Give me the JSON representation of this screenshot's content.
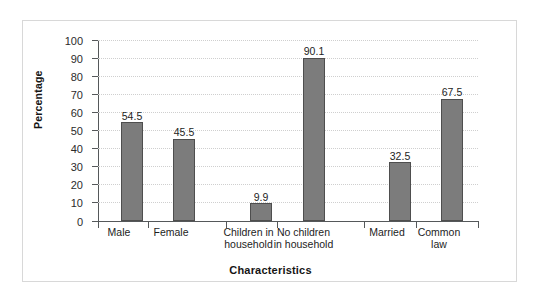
{
  "chart_data": {
    "type": "bar",
    "title": "",
    "subtitle": "",
    "xlabel": "Characteristics",
    "ylabel": "Percentage",
    "categories": [
      "Male",
      "Female",
      "Children in\nhousehold",
      "No children\nin household",
      "Married",
      "Common\nlaw"
    ],
    "values": [
      54.5,
      45.5,
      9.9,
      90.1,
      32.5,
      67.5
    ],
    "value_labels": [
      "54.5",
      "45.5",
      "9.9",
      "90.1",
      "32.5",
      "67.5"
    ],
    "ylim": [
      0,
      100
    ],
    "ytick_step": 10,
    "ytick_labels": [
      "100",
      "90",
      "80",
      "70",
      "60",
      "50",
      "40",
      "30",
      "20",
      "10",
      "0"
    ],
    "ytick_values": [
      100,
      90,
      80,
      70,
      60,
      50,
      40,
      30,
      20,
      10,
      0
    ],
    "grid": true,
    "grid_axis": "y",
    "grid_style": "dotted",
    "legend": false,
    "legend_position": "none",
    "groups": [
      {
        "name": "sex",
        "categories": [
          "Male",
          "Female"
        ]
      },
      {
        "name": "children",
        "categories": [
          "Children in household",
          "No children in household"
        ]
      },
      {
        "name": "marital-status",
        "categories": [
          "Married",
          "Common law"
        ]
      }
    ],
    "colors": {
      "bar_fill": "#7c7c7c",
      "bar_border": "#4e4e4e",
      "axis": "#55585a",
      "grid": "#cfcfcf",
      "frame": "#d8d8d8",
      "background": "#ffffff",
      "text": "#1d1d1d"
    }
  }
}
